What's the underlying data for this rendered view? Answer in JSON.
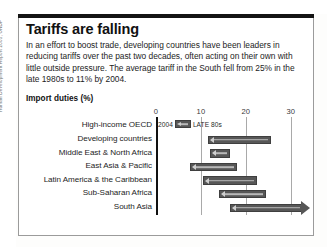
{
  "figure": {
    "title": "Tariffs are falling",
    "body": "In an effort to boost trade, developing countries have been leaders in reducing tariffs over the past two decades, often acting on their own with little outside pressure. The average tariff in the South fell from 25% in the late 1980s to 11% by 2004.",
    "source": "Human Development Report 2005, UNDP"
  },
  "legend": {
    "left_label": "2004",
    "right_label": "LATE 80s"
  },
  "colors": {
    "bar_fill": "#575757",
    "bar_stroke": "#3f3f3f",
    "bar_inner_line": "#b9b9b9",
    "gridline": "#a9a9a9",
    "axis": "#111111",
    "rule": "#141414",
    "box_border": "#9b9b9b"
  },
  "chart_data": {
    "type": "bar",
    "orientation": "horizontal",
    "title": "Import duties (%)",
    "subtitle": "Import duties (%)",
    "xlabel": "",
    "ylabel": "",
    "xlim": [
      0,
      32.5
    ],
    "ticks": [
      0,
      10,
      20,
      30
    ],
    "tick_labels": [
      "0",
      "10",
      "20",
      "30"
    ],
    "grid": true,
    "legend_position": "inside-first-row",
    "note": "Each bar is a range arrow pointing left: right end = late 1980s tariff, left end (arrowhead) = 2004 tariff.",
    "categories": [
      "High-income OECD",
      "Developing countries",
      "Middle East & North Africa",
      "East Asia & Pacific",
      "Latin America & the Caribbean",
      "Sub-Saharan Africa",
      "South Asia"
    ],
    "series": [
      {
        "name": "2004",
        "values": [
          null,
          11.5,
          12.0,
          7.5,
          10.5,
          14.0,
          16.5
        ]
      },
      {
        "name": "LATE 80s",
        "values": [
          null,
          25.5,
          16.5,
          18.0,
          22.5,
          24.5,
          32.5
        ]
      }
    ],
    "bars": [
      {
        "category": "High-income OECD",
        "start": null,
        "end": null,
        "legend_row": true
      },
      {
        "category": "Developing countries",
        "start": 11.5,
        "end": 25.5
      },
      {
        "category": "Middle East & North Africa",
        "start": 12.0,
        "end": 16.5
      },
      {
        "category": "East Asia & Pacific",
        "start": 7.5,
        "end": 18.0
      },
      {
        "category": "Latin America & the Caribbean",
        "start": 10.5,
        "end": 22.5
      },
      {
        "category": "Sub-Saharan Africa",
        "start": 14.0,
        "end": 24.5
      },
      {
        "category": "South Asia",
        "start": 16.5,
        "end": 32.5,
        "open_right": true
      }
    ]
  }
}
